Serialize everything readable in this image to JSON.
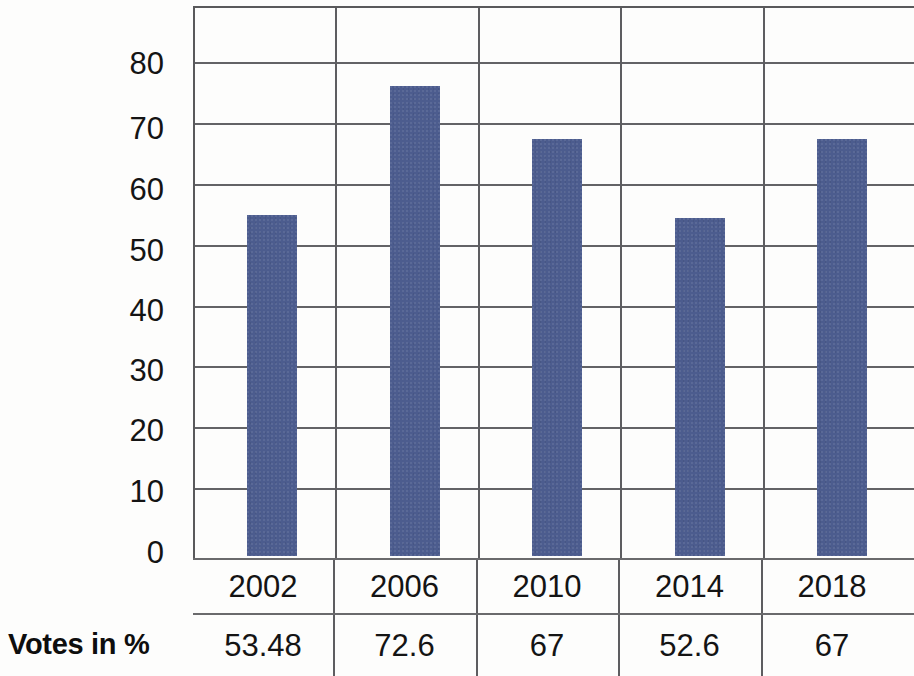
{
  "chart_data": {
    "type": "bar",
    "title": "",
    "subtitle": "",
    "xlabel": "",
    "ylabel": "",
    "categories": [
      "2002",
      "2006",
      "2010",
      "2014",
      "2018"
    ],
    "values": [
      53.48,
      72.6,
      67,
      52.6,
      67
    ],
    "bar_plotted_heights": [
      55,
      75.8,
      67.2,
      54.5,
      67.2
    ],
    "series": [
      {
        "name": "Votes in %",
        "values": [
          53.48,
          72.6,
          67,
          52.6,
          67
        ]
      }
    ],
    "ylim": [
      0,
      85
    ],
    "ytick_labels": [
      "80",
      "70",
      "60",
      "50",
      "40",
      "30",
      "20",
      "10",
      "0"
    ],
    "ytick_values": [
      80,
      70,
      60,
      50,
      40,
      30,
      20,
      10,
      0
    ],
    "grid": true,
    "grid_orientation": "both",
    "legend": "none",
    "bar_color": "#4c5c8e",
    "gridline_color": "#636366",
    "background_color": "#fdfdfc",
    "text_color": "#141414"
  },
  "table": {
    "rows": [
      {
        "label": "",
        "name": "year-row",
        "cells": [
          "2002",
          "2006",
          "2010",
          "2014",
          "2018"
        ]
      },
      {
        "label": "Votes in %",
        "name": "votes-row",
        "cells": [
          "53.48",
          "72.6",
          "67",
          "52.6",
          "67"
        ]
      }
    ]
  }
}
